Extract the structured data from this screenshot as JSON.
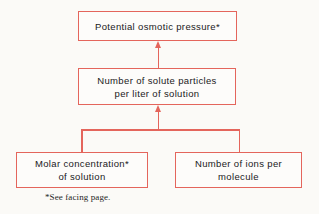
{
  "diagram": {
    "accent_color": "#e4655c",
    "background_color": "#fbfaf7",
    "text_color": "#1a1a1a",
    "nodes": {
      "potential_osmotic_pressure": {
        "line1": "Potential osmotic pressure*"
      },
      "solute_particles": {
        "line1": "Number of solute particles",
        "line2": "per liter of solution"
      },
      "molar_concentration": {
        "line1": "Molar concentration*",
        "line2": "of solution"
      },
      "ions_per_molecule": {
        "line1": "Number of ions per",
        "line2": "molecule"
      }
    },
    "footnote": "*See facing page."
  }
}
